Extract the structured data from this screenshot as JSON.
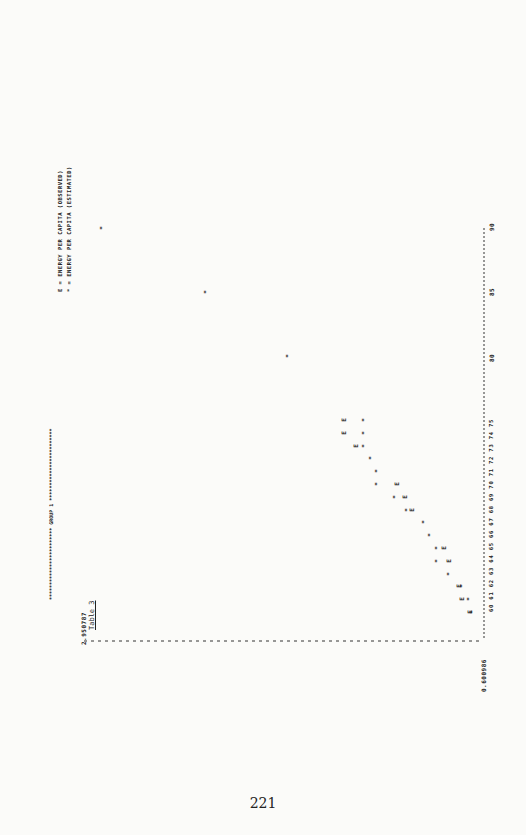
{
  "page": {
    "table_label": "Table 3",
    "page_number": "221",
    "title_banner": "************************ GROUP 1 ************************",
    "legend": [
      {
        "symbol": "E",
        "text": "E = ENERGY PER CAPITA (OBSERVED)"
      },
      {
        "symbol": "*",
        "text": "* = ENERGY PER CAPITA (ESTIMATED)"
      }
    ],
    "y_max_label": "2.950787",
    "y_min_label": "0.600986",
    "x_axis_ticks_text": "60 61 62 63 64 65 66 67 68 69 70 71 72 73 74 75",
    "x_axis_ticks_far": [
      "80",
      "85",
      "90"
    ]
  },
  "chart_data": {
    "type": "scatter",
    "title": "GROUP 1",
    "xlabel": "Year",
    "ylabel": "Energy per capita",
    "x_ticks": [
      60,
      61,
      62,
      63,
      64,
      65,
      66,
      67,
      68,
      69,
      70,
      71,
      72,
      73,
      74,
      75,
      80,
      85,
      90
    ],
    "ylim": [
      0.600986,
      2.950787
    ],
    "xlim": [
      60,
      90
    ],
    "grid": false,
    "legend_position": "top-right",
    "series": [
      {
        "name": "E = ENERGY PER CAPITA (OBSERVED)",
        "symbol": "E",
        "x": [
          60,
          61,
          62,
          64,
          65,
          68,
          69,
          70,
          73,
          74,
          75
        ],
        "values": [
          0.63,
          0.68,
          0.7,
          0.76,
          0.79,
          0.98,
          1.02,
          1.07,
          1.32,
          1.39,
          1.39
        ]
      },
      {
        "name": "* = ENERGY PER CAPITA (ESTIMATED)",
        "symbol": "*",
        "x": [
          60,
          61,
          62,
          63,
          64,
          65,
          66,
          67,
          68,
          69,
          70,
          71,
          72,
          73,
          74,
          75,
          80,
          85,
          90
        ],
        "values": [
          0.62,
          0.64,
          0.68,
          0.76,
          0.83,
          0.83,
          0.87,
          0.91,
          1.01,
          1.08,
          1.19,
          1.19,
          1.23,
          1.27,
          1.27,
          1.27,
          1.73,
          2.22,
          2.85
        ]
      }
    ]
  }
}
